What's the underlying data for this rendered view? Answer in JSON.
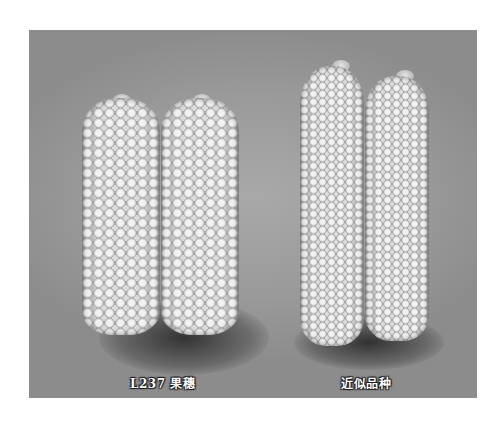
{
  "figure": {
    "background_color": "#9c9c9c",
    "groups": [
      {
        "label": "L237 果穗",
        "ear_count": 2,
        "shape": "short-thick"
      },
      {
        "label": "近似品种",
        "ear_count": 2,
        "shape": "long-slim"
      }
    ]
  }
}
